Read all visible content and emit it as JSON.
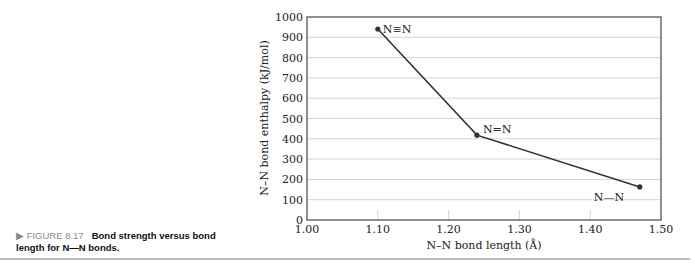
{
  "caption": {
    "figure_label": "▶ FIGURE 8.17",
    "title": "Bond strength versus bond length for N—N bonds."
  },
  "chart_data": {
    "type": "line",
    "title": "",
    "xlabel": "N–N bond length (Å)",
    "ylabel": "N–N bond enthalpy (kJ/mol)",
    "xlim": [
      1.0,
      1.5
    ],
    "ylim": [
      0,
      1000
    ],
    "x_ticks": [
      "1.00",
      "1.10",
      "1.20",
      "1.30",
      "1.40",
      "1.50"
    ],
    "y_ticks": [
      "0",
      "100",
      "200",
      "300",
      "400",
      "500",
      "600",
      "700",
      "800",
      "900",
      "1000"
    ],
    "grid": "horizontal",
    "series": [
      {
        "name": "N–N bonds",
        "x": [
          1.1,
          1.24,
          1.47
        ],
        "values": [
          941,
          418,
          163
        ],
        "labels": [
          "N≡N",
          "N=N",
          "N—N"
        ]
      }
    ],
    "legend": "none"
  },
  "colors": {
    "line": "#333333",
    "grid": "#d4d4d4",
    "axis": "#444444",
    "caption_figure": "#8a8a8a",
    "divider": "#bdbdbd"
  }
}
